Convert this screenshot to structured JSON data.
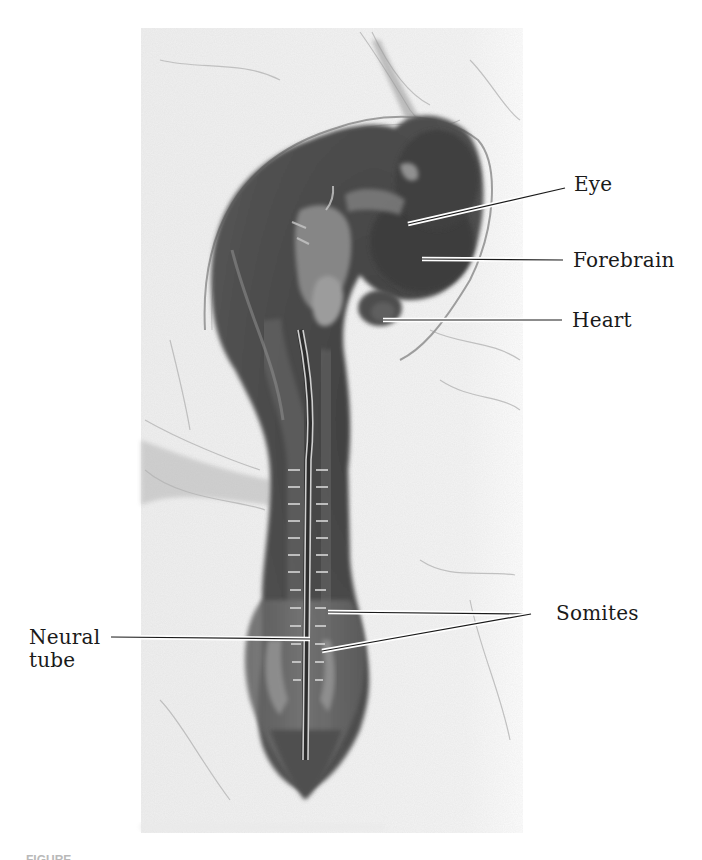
{
  "figure": {
    "labels": {
      "eye": "Eye",
      "forebrain": "Forebrain",
      "heart": "Heart",
      "somites": "Somites",
      "neural_tube_line1": "Neural",
      "neural_tube_line2": "tube"
    },
    "caption_partial": "FIGURE"
  },
  "colors": {
    "background": "#ffffff",
    "photo_background": "#f1f1f1",
    "embryo_dark": "#4a4a4a",
    "leader_line": "#1a1a1a",
    "label_text": "#1a1a1a"
  }
}
